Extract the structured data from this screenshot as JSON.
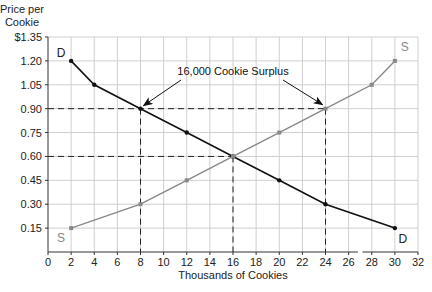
{
  "chart_data": {
    "type": "line",
    "title": "",
    "ylabel": "Price per Cookie",
    "ylabel_lines": [
      "Price per",
      "Cookie"
    ],
    "xlabel": "Thousands of Cookies",
    "xlim": [
      0,
      32
    ],
    "ylim": [
      0,
      1.35
    ],
    "x_ticks": [
      0,
      2,
      4,
      6,
      8,
      10,
      12,
      14,
      16,
      18,
      20,
      22,
      24,
      26,
      28,
      30,
      32
    ],
    "y_ticks": [
      0.15,
      0.3,
      0.45,
      0.6,
      0.75,
      0.9,
      1.05,
      1.2,
      1.35
    ],
    "y_tick_labels": [
      "0.15",
      "0.30",
      "0.45",
      "0.60",
      "0.75",
      "0.90",
      "1.05",
      "1.20",
      "$1.35"
    ],
    "grid": true,
    "series": [
      {
        "name": "Demand",
        "label": "D",
        "color": "#111111",
        "x": [
          2,
          4,
          8,
          12,
          16,
          20,
          24,
          30
        ],
        "y": [
          1.2,
          1.05,
          0.9,
          0.75,
          0.6,
          0.45,
          0.3,
          0.15
        ]
      },
      {
        "name": "Supply",
        "label": "S",
        "color": "#888888",
        "x": [
          2,
          8,
          12,
          16,
          20,
          24,
          28,
          30
        ],
        "y": [
          0.15,
          0.3,
          0.45,
          0.6,
          0.75,
          0.9,
          1.05,
          1.2
        ]
      }
    ],
    "reference_lines": [
      {
        "type": "horizontal",
        "y": 0.9,
        "x_from": 0,
        "x_to": 24,
        "style": "dashed"
      },
      {
        "type": "horizontal",
        "y": 0.6,
        "x_from": 0,
        "x_to": 16,
        "style": "dashed"
      },
      {
        "type": "vertical",
        "x": 8,
        "y_from": 0,
        "y_to": 0.9,
        "style": "dashed"
      },
      {
        "type": "vertical",
        "x": 16,
        "y_from": 0,
        "y_to": 0.6,
        "style": "dashed"
      },
      {
        "type": "vertical",
        "x": 24,
        "y_from": 0,
        "y_to": 0.9,
        "style": "dashed"
      }
    ],
    "annotations": [
      {
        "text": "16,000 Cookie Surplus",
        "x": 16,
        "y": 1.0,
        "arrows_to": [
          [
            8,
            0.9
          ],
          [
            24,
            0.9
          ]
        ]
      }
    ],
    "legend": "none (curves labeled D and S directly)"
  }
}
